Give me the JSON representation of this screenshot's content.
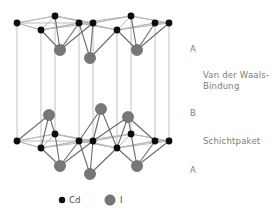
{
  "figure": {
    "kind": "crystal-structure-diagram",
    "compound": "CdI2",
    "background": "#ffffff"
  },
  "colors": {
    "cd_atom": "#0d0d0d",
    "i_atom": "#777777",
    "i_atom_stroke": "#5f5f5f",
    "bond_line": "#6b6b6b",
    "cell_edge": "#b8b8b8",
    "pillar": "#c2c2c2",
    "label_text": "#7d7d7d",
    "legend_text": "#4a4a4a"
  },
  "labels": {
    "layer_a_top": "A",
    "van_der_waals": "Van der Waals-",
    "van_der_waals_2": "Bindung",
    "layer_b": "B",
    "schichtpaket": "Schichtpaket",
    "layer_a_bottom": "A"
  },
  "legend": {
    "items": [
      {
        "symbol": "Cd",
        "marker": "small-black-dot",
        "radius": 3.0,
        "color": "#0d0d0d"
      },
      {
        "symbol": "I",
        "marker": "large-gray-circle",
        "radius": 5.2,
        "color": "#777777"
      }
    ]
  },
  "geometry": {
    "note": "oblique projection of hexagonal CdI2 cell; top cation plane y~22, lower cation plane y~140",
    "top_plane_y": 22,
    "mid_plane_y": 140,
    "rhombus_dx": 36,
    "rhombus_dy": 11
  },
  "atoms": {
    "cd_top_plane": [
      {
        "x": 17,
        "y": 23
      },
      {
        "x": 55,
        "y": 16
      },
      {
        "x": 93,
        "y": 23
      },
      {
        "x": 131,
        "y": 16
      },
      {
        "x": 169,
        "y": 23
      },
      {
        "x": 41,
        "y": 30
      },
      {
        "x": 79,
        "y": 23
      },
      {
        "x": 117,
        "y": 30
      },
      {
        "x": 155,
        "y": 23
      }
    ],
    "cd_mid_plane": [
      {
        "x": 17,
        "y": 141
      },
      {
        "x": 55,
        "y": 134
      },
      {
        "x": 93,
        "y": 141
      },
      {
        "x": 131,
        "y": 134
      },
      {
        "x": 169,
        "y": 141
      },
      {
        "x": 41,
        "y": 148
      },
      {
        "x": 79,
        "y": 141
      },
      {
        "x": 117,
        "y": 148
      },
      {
        "x": 155,
        "y": 141
      }
    ],
    "i_upper_of_top_packet": [
      {
        "x": 60,
        "y": 50
      },
      {
        "x": 90,
        "y": 58
      },
      {
        "x": 137,
        "y": 50
      }
    ],
    "i_above_mid_plane": [
      {
        "x": 49,
        "y": 115
      },
      {
        "x": 101,
        "y": 109
      },
      {
        "x": 128,
        "y": 117
      }
    ],
    "i_below_mid_plane": [
      {
        "x": 60,
        "y": 166
      },
      {
        "x": 90,
        "y": 174
      },
      {
        "x": 137,
        "y": 166
      }
    ]
  }
}
